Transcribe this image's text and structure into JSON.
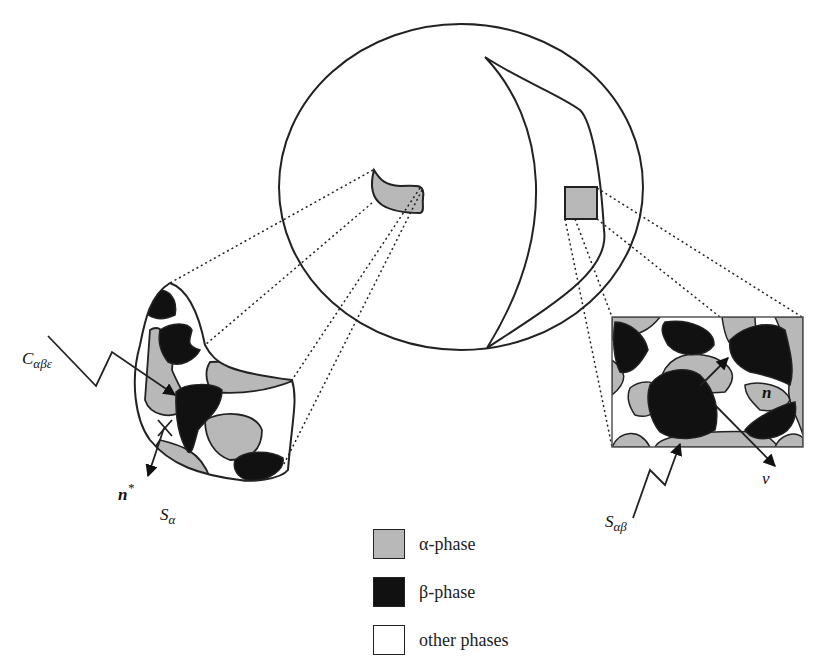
{
  "figure": {
    "type": "multiscale phase microstructure diagram",
    "colors": {
      "alpha_phase": "#b8b8b8",
      "beta_phase": "#111111",
      "other_phases": "#ffffff",
      "stroke": "#222222"
    }
  },
  "labels": {
    "triple_line": "C",
    "triple_line_sub": "αβε",
    "normal_star": "n",
    "normal_star_sup": "*",
    "surface_alpha": "S",
    "surface_alpha_sub": "α",
    "interface_ab": "S",
    "interface_ab_sub": "αβ",
    "normal_n": "n",
    "normal_nu": "ν"
  },
  "legend": {
    "items": [
      {
        "label": "α-phase",
        "color": "#b8b8b8"
      },
      {
        "label": "β-phase",
        "color": "#111111"
      },
      {
        "label": "other phases",
        "color": "#ffffff"
      }
    ]
  }
}
